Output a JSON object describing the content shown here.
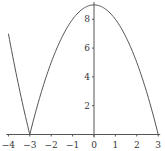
{
  "chart_data": {
    "type": "line",
    "title": "",
    "xlabel": "",
    "ylabel": "",
    "function": "y = |9 - x^2|",
    "xlim": [
      -4,
      3
    ],
    "ylim": [
      0,
      9
    ],
    "grid": false,
    "legend": null,
    "x_ticks": [
      -4,
      -3,
      -2,
      -1,
      0,
      1,
      2,
      3
    ],
    "y_ticks": [
      2,
      4,
      6,
      8
    ],
    "x_tick_labels": [
      "−4",
      "−3",
      "−2",
      "−1",
      "0",
      "1",
      "2",
      "3"
    ],
    "y_tick_labels": [
      "2",
      "4",
      "6",
      "8"
    ],
    "series": [
      {
        "name": "|9 - x^2|",
        "x": [
          -4,
          -3.5,
          -3,
          -2.5,
          -2,
          -1.5,
          -1,
          -0.5,
          0,
          0.5,
          1,
          1.5,
          2,
          2.5,
          3
        ],
        "values": [
          7,
          3.25,
          0,
          2.75,
          5,
          6.75,
          8,
          8.75,
          9,
          8.75,
          8,
          6.75,
          5,
          2.75,
          0
        ]
      }
    ],
    "colors": {
      "line": "#555555",
      "axis": "#555555",
      "text": "#333333"
    }
  }
}
